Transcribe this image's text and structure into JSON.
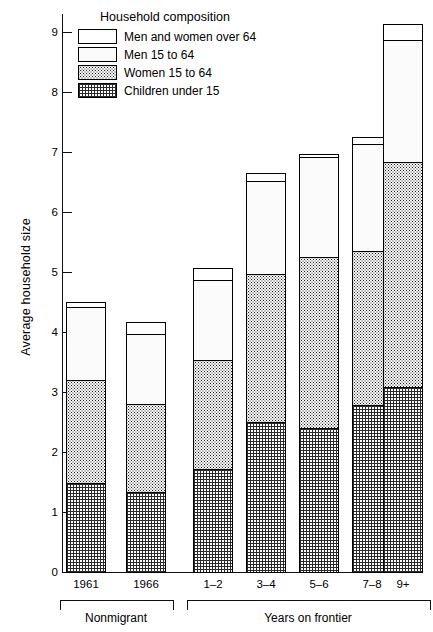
{
  "chart_data": {
    "type": "bar",
    "subtype": "stacked-bar",
    "title": "",
    "xlabel": "",
    "ylabel": "Average household size",
    "ylim": [
      0,
      9.4
    ],
    "yticks": [
      0,
      1,
      2,
      3,
      4,
      5,
      6,
      7,
      8,
      9
    ],
    "ytick_labels": [
      "0",
      "1",
      "2",
      "3",
      "4",
      "5",
      "6",
      "7",
      "8",
      "9"
    ],
    "grid": false,
    "legend_title": "Household composition",
    "legend_position": "top-left inside plot",
    "categories": [
      "1961",
      "1966",
      "1–2",
      "3–4",
      "5–6",
      "7–8",
      "9+"
    ],
    "group_labels": [
      "Nonmigrant",
      "Years on frontier"
    ],
    "groups": [
      {
        "label": "Nonmigrant",
        "categories": [
          "1961",
          "1966"
        ]
      },
      {
        "label": "Years on frontier",
        "categories": [
          "1–2",
          "3–4",
          "5–6",
          "7–8",
          "9+"
        ]
      }
    ],
    "series": [
      {
        "name": "Children under 15",
        "pattern": "fine-crosshatch",
        "values": [
          1.5,
          1.35,
          1.72,
          2.52,
          2.42,
          2.8,
          3.1
        ]
      },
      {
        "name": "Women 15 to 64",
        "pattern": "dense-dots",
        "values": [
          1.72,
          1.47,
          1.83,
          2.48,
          2.85,
          2.57,
          3.75
        ]
      },
      {
        "name": "Men 15 to 64",
        "pattern": "sparse-dots",
        "values": [
          1.23,
          1.18,
          1.35,
          1.55,
          1.68,
          1.8,
          2.05
        ]
      },
      {
        "name": "Men and women over 64",
        "pattern": "white",
        "values": [
          0.07,
          0.18,
          0.18,
          0.12,
          0.03,
          0.1,
          0.25
        ]
      }
    ],
    "totals": [
      4.52,
      4.18,
      5.08,
      6.67,
      6.98,
      7.27,
      9.15
    ],
    "cumulative_tops": [
      {
        "category": "1961",
        "children": 1.5,
        "women": 3.22,
        "men": 4.45,
        "over64": 4.52
      },
      {
        "category": "1966",
        "children": 1.35,
        "women": 2.82,
        "men": 4.0,
        "over64": 4.18
      },
      {
        "category": "1–2",
        "children": 1.72,
        "women": 3.55,
        "men": 4.9,
        "over64": 5.08
      },
      {
        "category": "3–4",
        "children": 2.52,
        "women": 5.0,
        "men": 6.55,
        "over64": 6.67
      },
      {
        "category": "5–6",
        "children": 2.42,
        "women": 5.27,
        "men": 6.95,
        "over64": 6.98
      },
      {
        "category": "7–8",
        "children": 2.8,
        "women": 5.37,
        "men": 7.17,
        "over64": 7.27
      },
      {
        "category": "9+",
        "children": 3.1,
        "women": 6.85,
        "men": 8.9,
        "over64": 9.15
      }
    ]
  },
  "legend": {
    "title": "Household composition",
    "items": [
      {
        "label": "Men and women over 64",
        "pattern": "white"
      },
      {
        "label": "Men 15 to 64",
        "pattern": "sparse-dots"
      },
      {
        "label": "Women 15 to 64",
        "pattern": "dense-dots"
      },
      {
        "label": "Children under 15",
        "pattern": "fine-crosshatch"
      }
    ]
  },
  "axes": {
    "y_title": "Average household size",
    "y_tick_labels": [
      "9",
      "8",
      "7",
      "6",
      "5",
      "4",
      "3",
      "2",
      "1",
      "0"
    ],
    "x_tick_labels": [
      "1961",
      "1966",
      "1–2",
      "3–4",
      "5–6",
      "7–8",
      "9+"
    ]
  },
  "colors": {
    "ink": "#000000",
    "background": "#ffffff"
  }
}
